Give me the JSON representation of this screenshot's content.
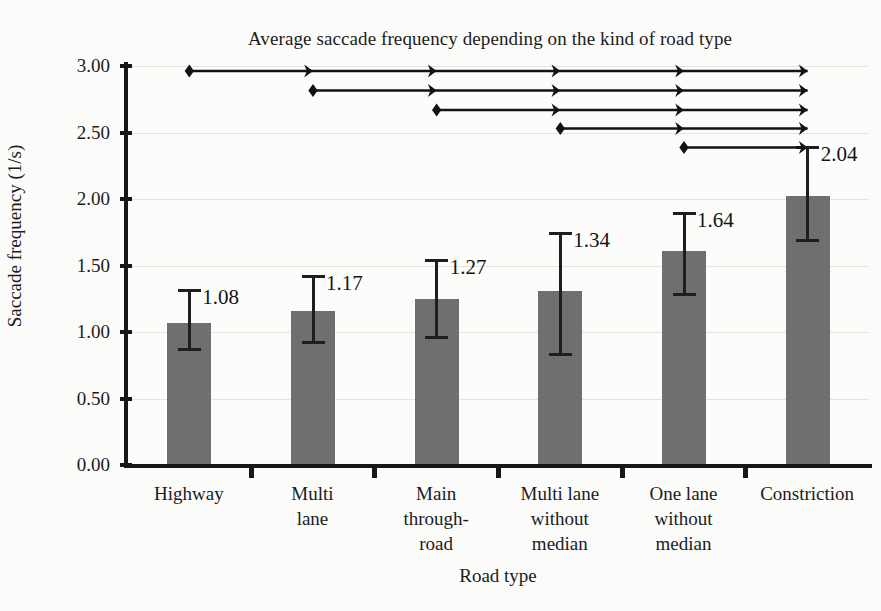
{
  "chart_data": {
    "type": "bar",
    "title": "Average saccade frequency depending on the kind of road type",
    "xlabel": "Road type",
    "ylabel": "Saccade frequency (1/s)",
    "categories": [
      "Highway",
      "Multi lane",
      "Main through-road",
      "Multi lane without median",
      "One lane without median",
      "Constriction"
    ],
    "category_lines": [
      [
        "Highway"
      ],
      [
        "Multi",
        "lane"
      ],
      [
        "Main",
        "through-",
        "road"
      ],
      [
        "Multi lane",
        "without",
        "median"
      ],
      [
        "One lane",
        "without",
        "median"
      ],
      [
        "Constriction"
      ]
    ],
    "values": [
      1.08,
      1.17,
      1.27,
      1.34,
      1.64,
      2.04
    ],
    "bar_tops": [
      1.07,
      1.16,
      1.25,
      1.31,
      1.61,
      2.02
    ],
    "data_labels": [
      "1.08",
      "1.17",
      "1.27",
      "1.34",
      "1.64",
      "2.04"
    ],
    "error_bars": [
      {
        "lower": 0.86,
        "upper": 1.32
      },
      {
        "lower": 0.91,
        "upper": 1.43
      },
      {
        "lower": 0.95,
        "upper": 1.55
      },
      {
        "lower": 0.82,
        "upper": 1.75
      },
      {
        "lower": 1.27,
        "upper": 1.9
      },
      {
        "lower": 1.68,
        "upper": 2.4
      }
    ],
    "ylim": [
      0.0,
      3.0
    ],
    "yticks": [
      0.0,
      0.5,
      1.0,
      1.5,
      2.0,
      2.5,
      3.0
    ],
    "ytick_labels": [
      "0.00",
      "0.50",
      "1.00",
      "1.50",
      "2.00",
      "2.50",
      "3.00"
    ],
    "grid": true,
    "legend": null,
    "bar_color": "#6f6f6f",
    "axis_color": "#171717",
    "grid_color": "#e3e3e0",
    "background_color": "#fcfcfb",
    "significance_arrows": [
      {
        "from_index": 0,
        "to_index": 5,
        "row": 0
      },
      {
        "from_index": 1,
        "to_index": 5,
        "row": 1
      },
      {
        "from_index": 2,
        "to_index": 5,
        "row": 2
      },
      {
        "from_index": 3,
        "to_index": 5,
        "row": 3
      },
      {
        "from_index": 4,
        "to_index": 5,
        "row": 4
      }
    ]
  }
}
